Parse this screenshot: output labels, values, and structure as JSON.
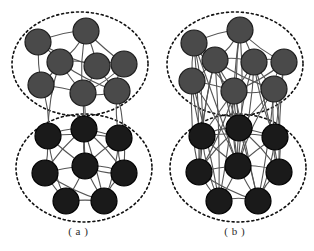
{
  "figure": {
    "background_color": "#ffffff",
    "panels": [
      {
        "id": "a",
        "caption": "( a )",
        "description": "Two loosely coupled communities with few inter-community links",
        "clusters": [
          {
            "name": "upper-community",
            "node_color": "#4a4a4a",
            "node_stroke": "#1c1c1c",
            "ellipse": {
              "cx": 80,
              "cy": 64,
              "rx": 68,
              "ry": 52,
              "stroke": "#111111",
              "dash": "2 3"
            },
            "nodes": [
              {
                "id": "a-u1",
                "x": 38,
                "y": 42,
                "r": 13
              },
              {
                "id": "a-u2",
                "x": 86,
                "y": 31,
                "r": 13
              },
              {
                "id": "a-u3",
                "x": 60,
                "y": 62,
                "r": 13
              },
              {
                "id": "a-u4",
                "x": 97,
                "y": 66,
                "r": 13
              },
              {
                "id": "a-u5",
                "x": 124,
                "y": 64,
                "r": 13
              },
              {
                "id": "a-u6",
                "x": 41,
                "y": 85,
                "r": 13
              },
              {
                "id": "a-u7",
                "x": 83,
                "y": 93,
                "r": 13
              },
              {
                "id": "a-u8",
                "x": 117,
                "y": 91,
                "r": 13
              }
            ],
            "edges": [
              [
                "a-u1",
                "a-u2"
              ],
              [
                "a-u1",
                "a-u3"
              ],
              [
                "a-u1",
                "a-u6"
              ],
              [
                "a-u1",
                "a-u4"
              ],
              [
                "a-u2",
                "a-u3"
              ],
              [
                "a-u2",
                "a-u4"
              ],
              [
                "a-u2",
                "a-u5"
              ],
              [
                "a-u2",
                "a-u7"
              ],
              [
                "a-u3",
                "a-u4"
              ],
              [
                "a-u3",
                "a-u6"
              ],
              [
                "a-u3",
                "a-u7"
              ],
              [
                "a-u3",
                "a-u8"
              ],
              [
                "a-u4",
                "a-u5"
              ],
              [
                "a-u4",
                "a-u7"
              ],
              [
                "a-u4",
                "a-u8"
              ],
              [
                "a-u5",
                "a-u8"
              ],
              [
                "a-u5",
                "a-u7"
              ],
              [
                "a-u6",
                "a-u7"
              ],
              [
                "a-u6",
                "a-u3"
              ],
              [
                "a-u7",
                "a-u8"
              ]
            ]
          },
          {
            "name": "lower-community",
            "node_color": "#1a1a1a",
            "node_stroke": "#000000",
            "ellipse": {
              "cx": 84,
              "cy": 168,
              "rx": 68,
              "ry": 54,
              "stroke": "#111111",
              "dash": "2 3"
            },
            "nodes": [
              {
                "id": "a-l1",
                "x": 48,
                "y": 136,
                "r": 13
              },
              {
                "id": "a-l2",
                "x": 84,
                "y": 129,
                "r": 13
              },
              {
                "id": "a-l3",
                "x": 119,
                "y": 138,
                "r": 13
              },
              {
                "id": "a-l4",
                "x": 45,
                "y": 173,
                "r": 13
              },
              {
                "id": "a-l5",
                "x": 85,
                "y": 166,
                "r": 13
              },
              {
                "id": "a-l6",
                "x": 124,
                "y": 173,
                "r": 13
              },
              {
                "id": "a-l7",
                "x": 66,
                "y": 201,
                "r": 13
              },
              {
                "id": "a-l8",
                "x": 104,
                "y": 201,
                "r": 13
              }
            ],
            "edges": [
              [
                "a-l1",
                "a-l2"
              ],
              [
                "a-l1",
                "a-l4"
              ],
              [
                "a-l1",
                "a-l5"
              ],
              [
                "a-l1",
                "a-l7"
              ],
              [
                "a-l1",
                "a-l3"
              ],
              [
                "a-l2",
                "a-l3"
              ],
              [
                "a-l2",
                "a-l5"
              ],
              [
                "a-l2",
                "a-l4"
              ],
              [
                "a-l2",
                "a-l6"
              ],
              [
                "a-l2",
                "a-l8"
              ],
              [
                "a-l3",
                "a-l5"
              ],
              [
                "a-l3",
                "a-l6"
              ],
              [
                "a-l3",
                "a-l8"
              ],
              [
                "a-l4",
                "a-l5"
              ],
              [
                "a-l4",
                "a-l7"
              ],
              [
                "a-l4",
                "a-l8"
              ],
              [
                "a-l5",
                "a-l6"
              ],
              [
                "a-l5",
                "a-l7"
              ],
              [
                "a-l5",
                "a-l8"
              ],
              [
                "a-l6",
                "a-l8"
              ],
              [
                "a-l6",
                "a-l5"
              ],
              [
                "a-l7",
                "a-l8"
              ]
            ]
          }
        ],
        "inter_edges": [
          [
            "a-u6",
            "a-l1"
          ],
          [
            "a-u7",
            "a-l2"
          ],
          [
            "a-u7",
            "a-l5"
          ],
          [
            "a-u8",
            "a-l3"
          ],
          [
            "a-u3",
            "a-l1"
          ],
          [
            "a-u8",
            "a-l6"
          ]
        ]
      },
      {
        "id": "b",
        "caption": "( b )",
        "description": "Two densely coupled communities with many inter-community links",
        "clusters": [
          {
            "name": "upper-community",
            "node_color": "#4a4a4a",
            "node_stroke": "#1c1c1c",
            "ellipse": {
              "cx": 235,
              "cy": 64,
              "rx": 68,
              "ry": 52,
              "stroke": "#111111",
              "dash": "2 3"
            },
            "nodes": [
              {
                "id": "b-u1",
                "x": 194,
                "y": 43,
                "r": 13
              },
              {
                "id": "b-u2",
                "x": 240,
                "y": 30,
                "r": 13
              },
              {
                "id": "b-u3",
                "x": 215,
                "y": 60,
                "r": 13
              },
              {
                "id": "b-u4",
                "x": 254,
                "y": 62,
                "r": 13
              },
              {
                "id": "b-u5",
                "x": 284,
                "y": 62,
                "r": 13
              },
              {
                "id": "b-u6",
                "x": 192,
                "y": 81,
                "r": 13
              },
              {
                "id": "b-u7",
                "x": 234,
                "y": 91,
                "r": 13
              },
              {
                "id": "b-u8",
                "x": 274,
                "y": 89,
                "r": 13
              }
            ],
            "edges": [
              [
                "b-u1",
                "b-u2"
              ],
              [
                "b-u1",
                "b-u3"
              ],
              [
                "b-u1",
                "b-u6"
              ],
              [
                "b-u1",
                "b-u7"
              ],
              [
                "b-u2",
                "b-u3"
              ],
              [
                "b-u2",
                "b-u4"
              ],
              [
                "b-u2",
                "b-u7"
              ],
              [
                "b-u2",
                "b-u5"
              ],
              [
                "b-u3",
                "b-u4"
              ],
              [
                "b-u3",
                "b-u6"
              ],
              [
                "b-u3",
                "b-u7"
              ],
              [
                "b-u3",
                "b-u8"
              ],
              [
                "b-u4",
                "b-u5"
              ],
              [
                "b-u4",
                "b-u7"
              ],
              [
                "b-u4",
                "b-u8"
              ],
              [
                "b-u5",
                "b-u8"
              ],
              [
                "b-u5",
                "b-u7"
              ],
              [
                "b-u6",
                "b-u7"
              ],
              [
                "b-u6",
                "b-u3"
              ],
              [
                "b-u7",
                "b-u8"
              ]
            ]
          },
          {
            "name": "lower-community",
            "node_color": "#1a1a1a",
            "node_stroke": "#000000",
            "ellipse": {
              "cx": 238,
              "cy": 168,
              "rx": 68,
              "ry": 54,
              "stroke": "#111111",
              "dash": "2 3"
            },
            "nodes": [
              {
                "id": "b-l1",
                "x": 202,
                "y": 136,
                "r": 13
              },
              {
                "id": "b-l2",
                "x": 239,
                "y": 128,
                "r": 13
              },
              {
                "id": "b-l3",
                "x": 275,
                "y": 137,
                "r": 13
              },
              {
                "id": "b-l4",
                "x": 199,
                "y": 172,
                "r": 13
              },
              {
                "id": "b-l5",
                "x": 238,
                "y": 166,
                "r": 13
              },
              {
                "id": "b-l6",
                "x": 279,
                "y": 172,
                "r": 13
              },
              {
                "id": "b-l7",
                "x": 219,
                "y": 201,
                "r": 13
              },
              {
                "id": "b-l8",
                "x": 258,
                "y": 201,
                "r": 13
              }
            ],
            "edges": [
              [
                "b-l1",
                "b-l2"
              ],
              [
                "b-l1",
                "b-l4"
              ],
              [
                "b-l1",
                "b-l5"
              ],
              [
                "b-l1",
                "b-l7"
              ],
              [
                "b-l1",
                "b-l3"
              ],
              [
                "b-l2",
                "b-l3"
              ],
              [
                "b-l2",
                "b-l5"
              ],
              [
                "b-l2",
                "b-l4"
              ],
              [
                "b-l2",
                "b-l6"
              ],
              [
                "b-l2",
                "b-l8"
              ],
              [
                "b-l3",
                "b-l5"
              ],
              [
                "b-l3",
                "b-l6"
              ],
              [
                "b-l3",
                "b-l8"
              ],
              [
                "b-l4",
                "b-l5"
              ],
              [
                "b-l4",
                "b-l7"
              ],
              [
                "b-l4",
                "b-l8"
              ],
              [
                "b-l5",
                "b-l6"
              ],
              [
                "b-l5",
                "b-l7"
              ],
              [
                "b-l5",
                "b-l8"
              ],
              [
                "b-l6",
                "b-l8"
              ],
              [
                "b-l7",
                "b-l8"
              ]
            ]
          }
        ],
        "inter_edges": [
          [
            "b-u1",
            "b-l1"
          ],
          [
            "b-u1",
            "b-l4"
          ],
          [
            "b-u1",
            "b-l5"
          ],
          [
            "b-u3",
            "b-l1"
          ],
          [
            "b-u3",
            "b-l4"
          ],
          [
            "b-u3",
            "b-l5"
          ],
          [
            "b-u3",
            "b-l7"
          ],
          [
            "b-u3",
            "b-l2"
          ],
          [
            "b-u6",
            "b-l1"
          ],
          [
            "b-u6",
            "b-l4"
          ],
          [
            "b-u6",
            "b-l5"
          ],
          [
            "b-u6",
            "b-l7"
          ],
          [
            "b-u7",
            "b-l1"
          ],
          [
            "b-u7",
            "b-l2"
          ],
          [
            "b-u7",
            "b-l5"
          ],
          [
            "b-u7",
            "b-l4"
          ],
          [
            "b-u7",
            "b-l7"
          ],
          [
            "b-u7",
            "b-l8"
          ],
          [
            "b-u4",
            "b-l2"
          ],
          [
            "b-u4",
            "b-l3"
          ],
          [
            "b-u4",
            "b-l5"
          ],
          [
            "b-u4",
            "b-l6"
          ],
          [
            "b-u8",
            "b-l2"
          ],
          [
            "b-u8",
            "b-l3"
          ],
          [
            "b-u8",
            "b-l5"
          ],
          [
            "b-u8",
            "b-l6"
          ],
          [
            "b-u8",
            "b-l8"
          ],
          [
            "b-u5",
            "b-l3"
          ],
          [
            "b-u5",
            "b-l6"
          ],
          [
            "b-u2",
            "b-l2"
          ],
          [
            "b-u2",
            "b-l5"
          ]
        ]
      }
    ],
    "edge_style": {
      "stroke": "#555555",
      "width": 1.1
    }
  }
}
